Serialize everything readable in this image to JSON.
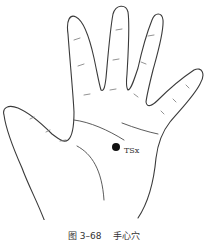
{
  "figure": {
    "caption_number": "图 3–68",
    "caption_title": "手心穴",
    "acupoint": {
      "label": "TSx",
      "color": "#111111"
    }
  }
}
